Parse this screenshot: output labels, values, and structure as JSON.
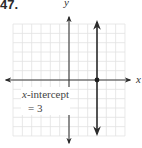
{
  "problem": {
    "number": "47."
  },
  "axes": {
    "x_label": "x",
    "y_label": "y"
  },
  "annotation": {
    "var": "x",
    "line1_rest": "-intercept",
    "line2": "= 3"
  },
  "colors": {
    "grid": "#e2e2e2",
    "axis": "#3a3a3a",
    "line": "#2b2b2b",
    "point": "#1e1e1e"
  },
  "chart_data": {
    "type": "line",
    "title": "",
    "xlabel": "x",
    "ylabel": "y",
    "xlim": [
      -6,
      6
    ],
    "ylim": [
      -6,
      6
    ],
    "grid": true,
    "series": [
      {
        "name": "x = 3",
        "x": [
          3,
          3
        ],
        "y": [
          -6,
          6
        ],
        "arrows": "both"
      }
    ],
    "points": [
      {
        "x": 3,
        "y": 0,
        "label": "x-intercept"
      }
    ],
    "annotations": [
      {
        "text": "x-intercept = 3",
        "x": -5,
        "y": -1
      }
    ]
  }
}
